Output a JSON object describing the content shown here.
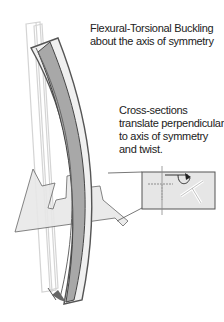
{
  "title": "Flexural-Torsional Buckling about the axis of symmetry",
  "labels": {
    "title_line1": "Flexural-Torsional Buckling",
    "title_line2": "about the axis of symmetry",
    "note_line1": "Cross-sections",
    "note_line2": "translate perpendicular",
    "note_line3": "to axis of symmetry",
    "note_line4": "and twist."
  },
  "colors": {
    "stroke_dark": "#555555",
    "stroke_light": "#cccccc",
    "fill_gray": "#aaaaaa",
    "plane_fill": "#e6e6e6"
  }
}
